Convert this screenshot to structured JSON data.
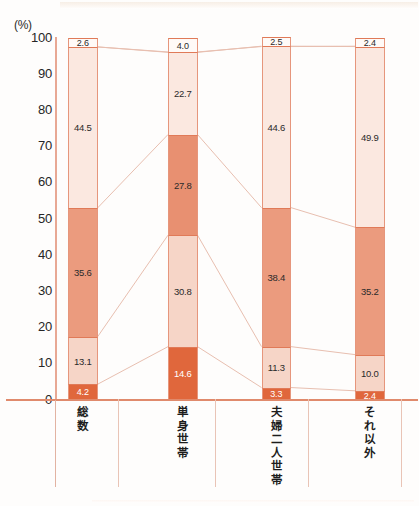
{
  "axis": {
    "unit_label": "(%)",
    "ticks": [
      "100",
      "90",
      "80",
      "70",
      "60",
      "50",
      "40",
      "30",
      "20",
      "10",
      "0"
    ]
  },
  "colors": {
    "seg1": "#e0673c",
    "seg2": "#f3c5b3",
    "seg3": "#ea9172",
    "seg4": "#fae3da",
    "seg5": "#fdf2ec",
    "outline": "#e07a58",
    "axis": "#e08a6c",
    "link_line": "#e8bfb0"
  },
  "chart_data": {
    "type": "bar",
    "title": "",
    "xlabel": "",
    "ylabel": "(%)",
    "ylim": [
      0,
      100
    ],
    "grid": false,
    "stacked": true,
    "stacked_percent": true,
    "legend": "none",
    "categories": [
      "総数",
      "単身世帯",
      "夫婦二人世帯",
      "それ以外"
    ],
    "series": [
      {
        "name": "seg1",
        "values": [
          4.2,
          14.6,
          3.3,
          2.4
        ]
      },
      {
        "name": "seg2",
        "values": [
          13.1,
          30.8,
          11.3,
          10.0
        ]
      },
      {
        "name": "seg3",
        "values": [
          35.6,
          27.8,
          38.4,
          35.2
        ]
      },
      {
        "name": "seg4",
        "values": [
          44.5,
          22.7,
          44.6,
          49.9
        ]
      },
      {
        "name": "seg5",
        "values": [
          2.6,
          4.0,
          2.5,
          2.4
        ]
      }
    ]
  },
  "bars": [
    {
      "category": "総数",
      "segments": [
        {
          "value": "4.2",
          "num": 4.2,
          "fill": "#e0673c",
          "text": "#ffffff"
        },
        {
          "value": "13.1",
          "num": 13.1,
          "fill": "#f6d5c7",
          "text": "#2a2a2a"
        },
        {
          "value": "35.6",
          "num": 35.6,
          "fill": "#eb9b7e",
          "text": "#2a2a2a"
        },
        {
          "value": "44.5",
          "num": 44.5,
          "fill": "#fbe8e0",
          "text": "#2a2a2a"
        },
        {
          "value": "2.6",
          "num": 2.6,
          "fill": "#fffaf7",
          "text": "#2a2a2a"
        }
      ]
    },
    {
      "category": "単身世帯",
      "segments": [
        {
          "value": "14.6",
          "num": 14.6,
          "fill": "#e0673c",
          "text": "#ffffff"
        },
        {
          "value": "30.8",
          "num": 30.8,
          "fill": "#f6d5c7",
          "text": "#2a2a2a"
        },
        {
          "value": "27.8",
          "num": 27.8,
          "fill": "#e89071",
          "text": "#2a2a2a"
        },
        {
          "value": "22.7",
          "num": 22.7,
          "fill": "#fbe8e0",
          "text": "#2a2a2a"
        },
        {
          "value": "4.0",
          "num": 4.0,
          "fill": "#fffaf7",
          "text": "#2a2a2a"
        }
      ]
    },
    {
      "category": "夫婦二人世帯",
      "segments": [
        {
          "value": "3.3",
          "num": 3.3,
          "fill": "#e0673c",
          "text": "#ffffff"
        },
        {
          "value": "11.3",
          "num": 11.3,
          "fill": "#f6d5c7",
          "text": "#2a2a2a"
        },
        {
          "value": "38.4",
          "num": 38.4,
          "fill": "#eb9b7e",
          "text": "#2a2a2a"
        },
        {
          "value": "44.6",
          "num": 44.6,
          "fill": "#fbe8e0",
          "text": "#2a2a2a"
        },
        {
          "value": "2.5",
          "num": 2.5,
          "fill": "#fffaf7",
          "text": "#2a2a2a"
        }
      ]
    },
    {
      "category": "それ以外",
      "segments": [
        {
          "value": "2.4",
          "num": 2.4,
          "fill": "#e0673c",
          "text": "#ffffff"
        },
        {
          "value": "10.0",
          "num": 10.0,
          "fill": "#f6d5c7",
          "text": "#2a2a2a"
        },
        {
          "value": "35.2",
          "num": 35.2,
          "fill": "#eb9b7e",
          "text": "#2a2a2a"
        },
        {
          "value": "49.9",
          "num": 49.9,
          "fill": "#fbe8e0",
          "text": "#2a2a2a"
        },
        {
          "value": "2.4",
          "num": 2.4,
          "fill": "#fffaf7",
          "text": "#2a2a2a"
        }
      ]
    }
  ]
}
